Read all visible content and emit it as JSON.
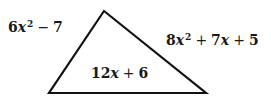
{
  "diagram": {
    "shape": "triangle",
    "stroke_color": "#111111",
    "vertices": {
      "top": [
        104,
        11
      ],
      "bottom_left": [
        49,
        93
      ],
      "bottom_right": [
        206,
        93
      ]
    },
    "sides": {
      "left": {
        "coef": "6",
        "var": "x",
        "exp": "2",
        "op1": "−",
        "const": "7",
        "text": "6x^2 − 7"
      },
      "right": {
        "coef": "8",
        "var": "x",
        "exp": "2",
        "op1": "+",
        "coef2": "7",
        "var2": "x",
        "op2": "+",
        "const": "5",
        "text": "8x^2 + 7x + 5"
      },
      "bottom": {
        "coef": "12",
        "var": "x",
        "op1": "+",
        "const": "6",
        "text": "12x + 6"
      }
    }
  }
}
